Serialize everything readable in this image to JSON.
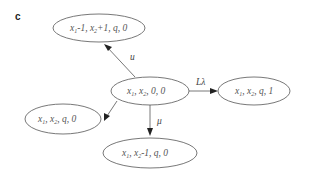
{
  "panel_label": "c",
  "nodes": {
    "center": {
      "parts": [
        "x",
        "1",
        ", x",
        "2",
        ", 0, 0"
      ]
    },
    "top": {
      "parts": [
        "x",
        "1",
        "-1, x",
        "2",
        "+1, q, 0"
      ]
    },
    "right": {
      "parts": [
        "x",
        "1",
        ", x",
        "2",
        ", q, 1"
      ]
    },
    "left": {
      "parts": [
        "x",
        "1",
        ", x",
        "2",
        ", q, 0"
      ]
    },
    "bottom": {
      "parts": [
        "x",
        "1",
        ", x",
        "2",
        "-1, q, 0"
      ]
    }
  },
  "edges": {
    "to_top": {
      "label": "u"
    },
    "to_right": {
      "label": "Lλ"
    },
    "to_left": {
      "label": ""
    },
    "to_bottom": {
      "label": "μ"
    }
  }
}
